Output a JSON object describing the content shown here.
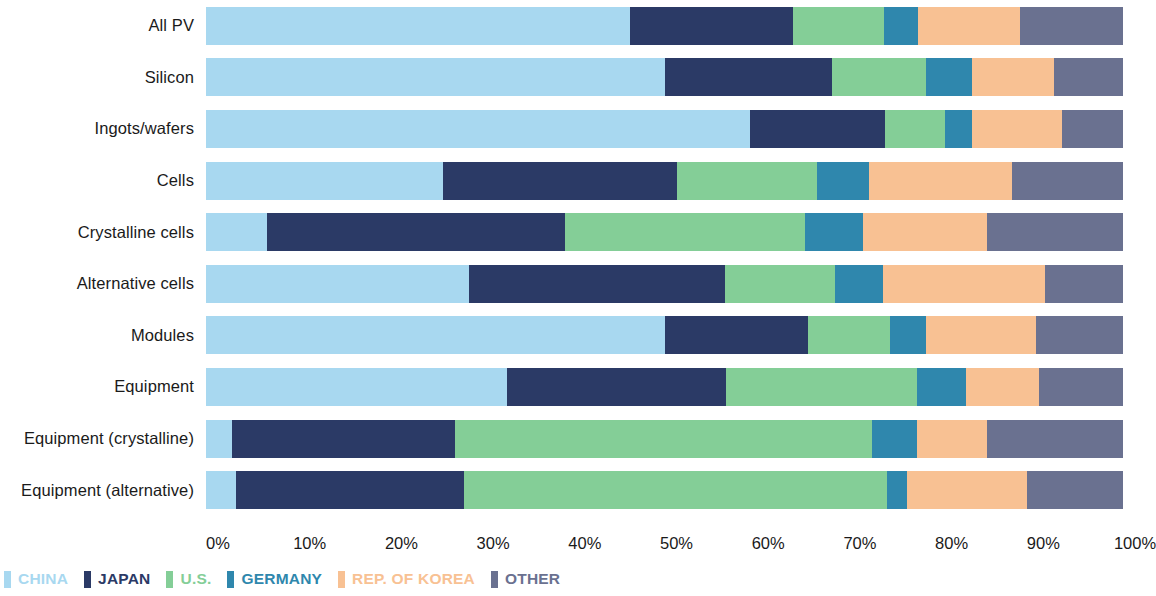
{
  "chart_data": {
    "type": "bar",
    "orientation": "horizontal",
    "stacked": true,
    "normalized": true,
    "title": "",
    "subtitle": "",
    "xlabel": "",
    "ylabel": "",
    "xlim": [
      0,
      100
    ],
    "grid": false,
    "legend_position": "bottom-left",
    "tick_labels": [
      "0%",
      "10%",
      "20%",
      "30%",
      "40%",
      "50%",
      "60%",
      "70%",
      "80%",
      "90%",
      "100%"
    ],
    "tick_values": [
      0,
      10,
      20,
      30,
      40,
      50,
      60,
      70,
      80,
      90,
      100
    ],
    "categories": [
      "All PV",
      "Silicon",
      "Ingots/wafers",
      "Cells",
      "Crystalline cells",
      "Alternative cells",
      "Modules",
      "Equipment",
      "Equipment (crystalline)",
      "Equipment (alternative)"
    ],
    "series": [
      {
        "name": "CHINA",
        "color": "#a8d8f0",
        "values": [
          46.2,
          50.0,
          59.3,
          25.8,
          6.6,
          28.7,
          50.0,
          32.8,
          2.8,
          3.3
        ]
      },
      {
        "name": "JAPAN",
        "color": "#2b3a66",
        "values": [
          17.8,
          18.3,
          14.7,
          25.6,
          32.6,
          27.9,
          15.7,
          23.9,
          24.4,
          24.8
        ]
      },
      {
        "name": "U.S.",
        "color": "#84ce97",
        "values": [
          9.9,
          10.2,
          6.6,
          15.2,
          26.1,
          12.0,
          8.9,
          20.8,
          45.4,
          46.2
        ]
      },
      {
        "name": "GERMANY",
        "color": "#2f87ad",
        "values": [
          3.7,
          5.0,
          2.9,
          5.7,
          6.3,
          5.2,
          3.9,
          5.4,
          4.9,
          2.2
        ]
      },
      {
        "name": "REP. OF KOREA",
        "color": "#f8c193",
        "values": [
          11.2,
          9.0,
          9.9,
          15.6,
          13.6,
          17.7,
          12.0,
          7.9,
          7.7,
          13.0
        ]
      },
      {
        "name": "OTHER",
        "color": "#6a7190",
        "values": [
          11.2,
          7.5,
          6.6,
          12.1,
          14.8,
          8.5,
          9.5,
          9.2,
          14.8,
          10.5
        ]
      }
    ]
  },
  "legend": {
    "items": [
      {
        "label": "CHINA",
        "color": "#a8d8f0"
      },
      {
        "label": "JAPAN",
        "color": "#2b3a66"
      },
      {
        "label": "U.S.",
        "color": "#84ce97"
      },
      {
        "label": "GERMANY",
        "color": "#2f87ad"
      },
      {
        "label": "REP. OF KOREA",
        "color": "#f8c193"
      },
      {
        "label": "OTHER",
        "color": "#6a7190"
      }
    ]
  }
}
